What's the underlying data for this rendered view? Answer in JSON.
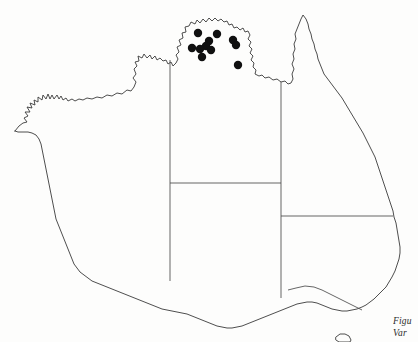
{
  "figure": {
    "type": "distribution-map",
    "region": "Australia",
    "background_color": "#fdfdfc",
    "outline_color": "#3a3a3a",
    "dot_color": "#101010",
    "caption": {
      "line1": "Figu",
      "line2": "Var",
      "clipped": true
    }
  },
  "chart_data": {
    "type": "scatter",
    "title": "",
    "xlabel": "",
    "ylabel": "",
    "grid": false,
    "legend": "none",
    "xlim": [
      0,
      418
    ],
    "ylim": [
      342,
      0
    ],
    "series": [
      {
        "name": "occurrence-records",
        "marker": "filled-circle",
        "color": "#101010",
        "radius": 4.2,
        "points": [
          {
            "x": 198,
            "y": 33
          },
          {
            "x": 217,
            "y": 34
          },
          {
            "x": 209,
            "y": 41
          },
          {
            "x": 206,
            "y": 46
          },
          {
            "x": 192,
            "y": 48
          },
          {
            "x": 200,
            "y": 49
          },
          {
            "x": 211,
            "y": 50
          },
          {
            "x": 202,
            "y": 57
          },
          {
            "x": 233,
            "y": 40
          },
          {
            "x": 236,
            "y": 45
          },
          {
            "x": 238,
            "y": 65
          }
        ]
      }
    ]
  },
  "map": {
    "state_borders": [
      {
        "name": "wa-nt-sa-border",
        "orientation": "vertical"
      },
      {
        "name": "nt-qld-border",
        "orientation": "vertical"
      },
      {
        "name": "nt-sa-border",
        "orientation": "horizontal"
      },
      {
        "name": "sa-nsw-qld-border",
        "orientation": "horizontal"
      },
      {
        "name": "nsw-vic-border",
        "orientation": "diagonal"
      }
    ]
  }
}
